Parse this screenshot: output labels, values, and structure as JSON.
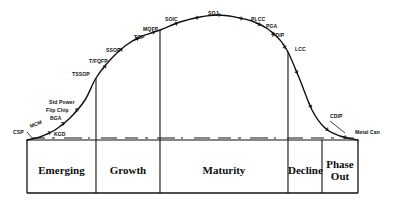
{
  "chart_data": {
    "type": "line",
    "title": "",
    "xlabel": "",
    "ylabel": "",
    "curve_points": [
      [
        27,
        140
      ],
      [
        40,
        137
      ],
      [
        55,
        130
      ],
      [
        70,
        118
      ],
      [
        85,
        100
      ],
      [
        96,
        78
      ],
      [
        110,
        60
      ],
      [
        125,
        46
      ],
      [
        140,
        37
      ],
      [
        160,
        30
      ],
      [
        180,
        22
      ],
      [
        200,
        17
      ],
      [
        218,
        15
      ],
      [
        235,
        17
      ],
      [
        252,
        21
      ],
      [
        268,
        29
      ],
      [
        280,
        40
      ],
      [
        288,
        52
      ],
      [
        300,
        80
      ],
      [
        312,
        110
      ],
      [
        325,
        128
      ],
      [
        340,
        136
      ],
      [
        358,
        140
      ]
    ],
    "phases": [
      {
        "label": "Emerging",
        "x0": 27,
        "x1": 96
      },
      {
        "label": "Growth",
        "x0": 96,
        "x1": 160
      },
      {
        "label": "Maturity",
        "x0": 160,
        "x1": 288
      },
      {
        "label": "Decline",
        "x0": 288,
        "x1": 322
      },
      {
        "label": "Phase\nOut",
        "x0": 322,
        "x1": 358
      }
    ],
    "packages": [
      {
        "name": "CSP",
        "x": 13,
        "y": 134,
        "rotate": 0,
        "anchor": "start"
      },
      {
        "name": "MCM",
        "x": 31,
        "y": 128,
        "rotate": -22,
        "anchor": "start"
      },
      {
        "name": "KGD",
        "x": 54,
        "y": 136,
        "rotate": 0,
        "anchor": "start"
      },
      {
        "name": "BGA",
        "x": 50,
        "y": 120,
        "rotate": 0,
        "anchor": "start"
      },
      {
        "name": "Flip Chip",
        "x": 46,
        "y": 112,
        "rotate": 0,
        "anchor": "start"
      },
      {
        "name": "Std Power",
        "x": 49,
        "y": 104,
        "rotate": 0,
        "anchor": "start"
      },
      {
        "name": "TSSOP",
        "x": 72,
        "y": 76,
        "rotate": 0,
        "anchor": "start"
      },
      {
        "name": "T/FQFP",
        "x": 89,
        "y": 63,
        "rotate": 0,
        "anchor": "start"
      },
      {
        "name": "SSOP",
        "x": 106,
        "y": 52,
        "rotate": 0,
        "anchor": "start"
      },
      {
        "name": "TCP",
        "x": 134,
        "y": 39,
        "rotate": 0,
        "anchor": "start"
      },
      {
        "name": "MQFP",
        "x": 143,
        "y": 31,
        "rotate": 0,
        "anchor": "start"
      },
      {
        "name": "SOIC",
        "x": 165,
        "y": 21,
        "rotate": 0,
        "anchor": "start"
      },
      {
        "name": "SOJ",
        "x": 208,
        "y": 15,
        "rotate": 0,
        "anchor": "start"
      },
      {
        "name": "PLCC",
        "x": 251,
        "y": 21,
        "rotate": 0,
        "anchor": "start"
      },
      {
        "name": "PGA",
        "x": 266,
        "y": 28,
        "rotate": 0,
        "anchor": "start"
      },
      {
        "name": "PDIP",
        "x": 272,
        "y": 37,
        "rotate": 0,
        "anchor": "start"
      },
      {
        "name": "LCC",
        "x": 295,
        "y": 51,
        "rotate": 0,
        "anchor": "start"
      },
      {
        "name": "CDIP",
        "x": 330,
        "y": 118,
        "rotate": 0,
        "anchor": "start"
      },
      {
        "name": "Metal Can",
        "x": 355,
        "y": 134,
        "rotate": 0,
        "anchor": "start"
      }
    ],
    "axis": {
      "baseline_y": 140,
      "box_bottom_y": 193,
      "left_x": 27,
      "right_x": 358,
      "dashed_line_y": 138,
      "grid": false
    },
    "colors": {
      "ink": "#111111",
      "background": "#ffffff"
    }
  }
}
